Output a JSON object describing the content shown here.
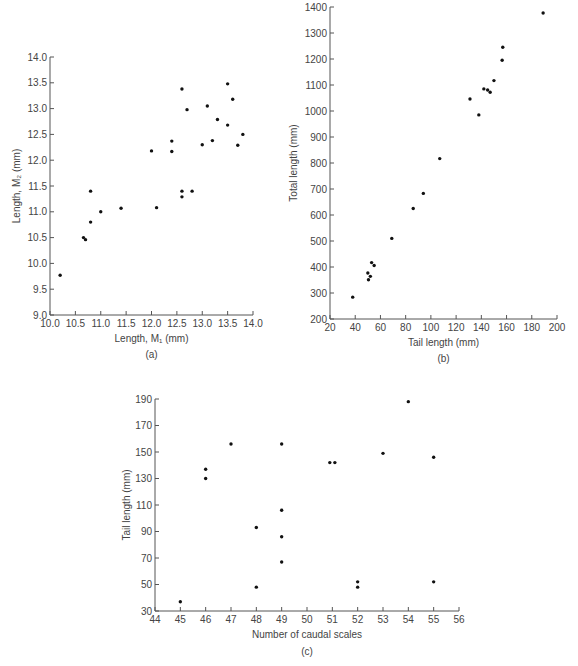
{
  "chart_data": [
    {
      "id": "a",
      "type": "scatter",
      "panel_label": "(a)",
      "title": "",
      "xlabel": "Length, M₁ (mm)",
      "ylabel": "Length, M₂ (mm)",
      "xlim": [
        10.0,
        14.0
      ],
      "ylim": [
        9.0,
        14.0
      ],
      "xticks": [
        "10.0",
        "10.5",
        "11.0",
        "11.5",
        "12.0",
        "12.5",
        "13.0",
        "13.5",
        "14.0"
      ],
      "yticks": [
        "9.0",
        "9.5",
        "10.0",
        "10.5",
        "11.0",
        "11.5",
        "12.0",
        "12.5",
        "13.0",
        "13.5",
        "14.0"
      ],
      "grid": false,
      "legend": null,
      "points": [
        [
          10.2,
          9.77
        ],
        [
          10.66,
          10.5
        ],
        [
          10.7,
          10.46
        ],
        [
          10.8,
          11.4
        ],
        [
          10.8,
          10.8
        ],
        [
          11.0,
          11.0
        ],
        [
          11.4,
          11.07
        ],
        [
          12.0,
          12.18
        ],
        [
          12.1,
          11.08
        ],
        [
          12.4,
          12.17
        ],
        [
          12.4,
          12.37
        ],
        [
          12.6,
          13.38
        ],
        [
          12.6,
          11.4
        ],
        [
          12.6,
          11.29
        ],
        [
          12.7,
          12.98
        ],
        [
          12.8,
          11.4
        ],
        [
          13.0,
          12.3
        ],
        [
          13.1,
          13.05
        ],
        [
          13.2,
          12.38
        ],
        [
          13.3,
          12.79
        ],
        [
          13.5,
          13.48
        ],
        [
          13.5,
          12.68
        ],
        [
          13.6,
          13.18
        ],
        [
          13.7,
          12.29
        ],
        [
          13.8,
          12.5
        ]
      ]
    },
    {
      "id": "b",
      "type": "scatter",
      "panel_label": "(b)",
      "title": "",
      "xlabel": "Tail length (mm)",
      "ylabel": "Total length (mm)",
      "xlim": [
        20,
        200
      ],
      "ylim": [
        200,
        1400
      ],
      "xticks": [
        "20",
        "40",
        "60",
        "80",
        "100",
        "120",
        "140",
        "160",
        "180",
        "200"
      ],
      "yticks": [
        "200",
        "300",
        "400",
        "500",
        "600",
        "700",
        "800",
        "900",
        "1000",
        "1100",
        "1200",
        "1300",
        "1400"
      ],
      "grid": false,
      "legend": null,
      "points": [
        [
          38,
          284
        ],
        [
          50,
          377
        ],
        [
          50.5,
          351
        ],
        [
          52,
          364
        ],
        [
          53,
          417
        ],
        [
          55,
          406
        ],
        [
          69,
          510
        ],
        [
          86,
          625
        ],
        [
          94,
          683
        ],
        [
          107,
          817
        ],
        [
          131,
          1046
        ],
        [
          138,
          985
        ],
        [
          142,
          1085
        ],
        [
          145,
          1081
        ],
        [
          147,
          1072
        ],
        [
          150,
          1117
        ],
        [
          156.5,
          1195
        ],
        [
          157,
          1245
        ],
        [
          189,
          1377
        ]
      ]
    },
    {
      "id": "c",
      "type": "scatter",
      "panel_label": "(c)",
      "title": "",
      "xlabel": "Number of caudal scales",
      "ylabel": "Tail length (mm)",
      "xlim": [
        44,
        56
      ],
      "ylim": [
        30,
        190
      ],
      "xticks": [
        "44",
        "45",
        "46",
        "47",
        "48",
        "49",
        "50",
        "51",
        "52",
        "53",
        "54",
        "55",
        "56"
      ],
      "yticks": [
        "30",
        "50",
        "70",
        "90",
        "110",
        "130",
        "150",
        "170",
        "190"
      ],
      "grid": false,
      "legend": null,
      "points": [
        [
          45,
          37
        ],
        [
          46,
          137
        ],
        [
          46,
          130
        ],
        [
          47,
          156
        ],
        [
          48,
          93
        ],
        [
          48,
          48
        ],
        [
          49,
          156
        ],
        [
          49,
          106
        ],
        [
          49,
          86
        ],
        [
          49,
          67
        ],
        [
          50.9,
          142
        ],
        [
          51.1,
          142
        ],
        [
          52,
          52
        ],
        [
          52,
          48
        ],
        [
          53,
          149
        ],
        [
          54,
          188
        ],
        [
          55,
          146
        ],
        [
          55,
          52
        ]
      ]
    }
  ]
}
